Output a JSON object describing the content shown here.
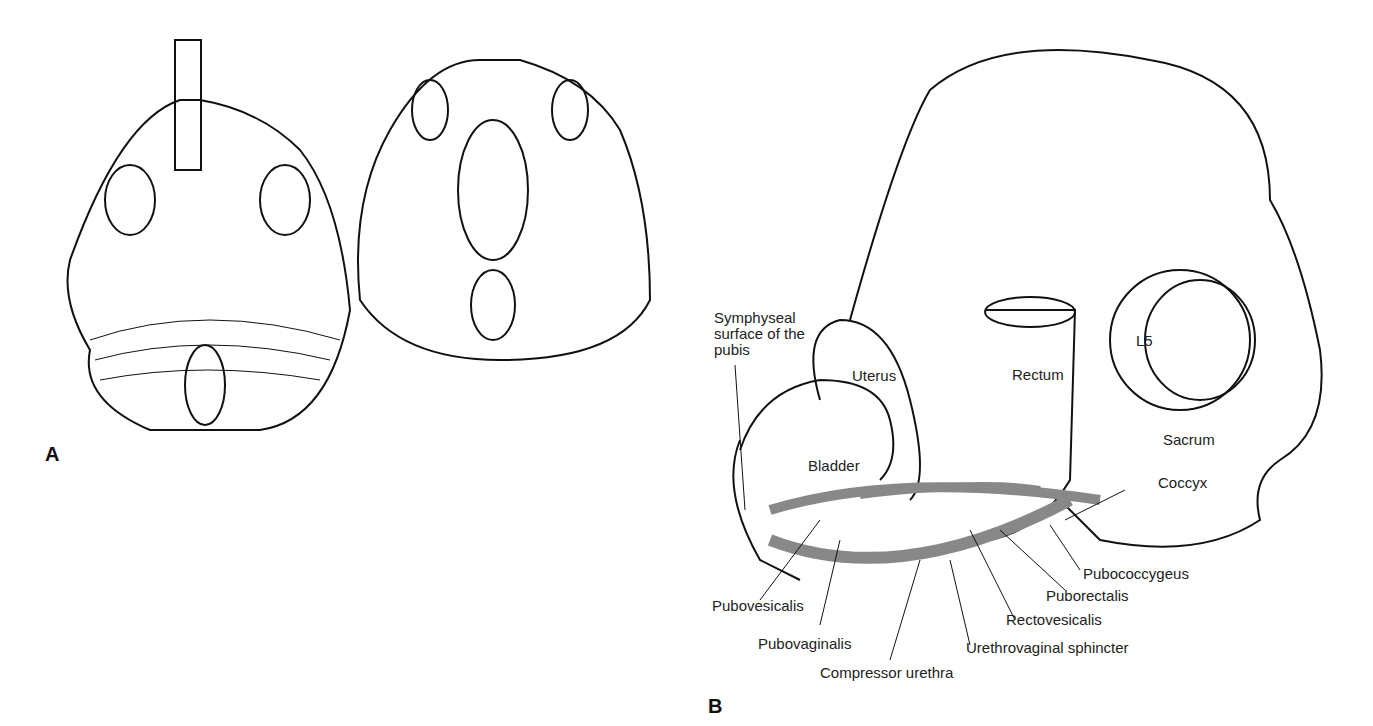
{
  "panels": {
    "a": "A",
    "b": "B"
  },
  "labels": {
    "symphyseal": "Symphyseal\nsurface of the\npubis",
    "uterus": "Uterus",
    "rectum": "Rectum",
    "l5": "L5",
    "bladder": "Bladder",
    "sacrum": "Sacrum",
    "coccyx": "Coccyx",
    "pubococcygeus": "Pubococcygeus",
    "puborectalis": "Puborectalis",
    "rectovesicalis": "Rectovesicalis",
    "pubovesicalis": "Pubovesicalis",
    "pubovaginalis": "Pubovaginalis",
    "urethrovaginal": "Urethrovaginal sphincter",
    "compressor": "Compressor urethra"
  }
}
